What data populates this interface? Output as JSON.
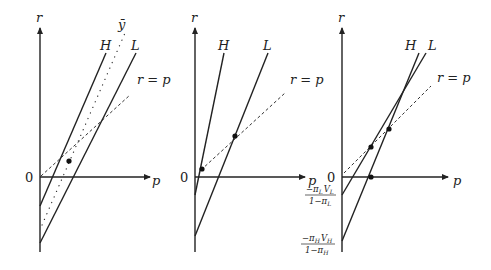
{
  "diagram": {
    "panels": [
      {
        "id": "panel-1",
        "axis_y_label": "r",
        "axis_x_label": "p",
        "origin_label": "0",
        "line_labels": {
          "H": "H",
          "L": "L",
          "ybar": "ȳ",
          "diag": "r = p"
        }
      },
      {
        "id": "panel-2",
        "axis_y_label": "r",
        "axis_x_label": "p",
        "origin_label": "0",
        "line_labels": {
          "H": "H",
          "L": "L",
          "diag": "r = p"
        }
      },
      {
        "id": "panel-3",
        "axis_y_label": "r",
        "axis_x_label": "p",
        "origin_label": "0",
        "line_labels": {
          "H": "H",
          "L": "L",
          "diag": "r = p"
        },
        "intercepts": {
          "L_num": "−π",
          "L_num_sub": "L",
          "L_num_v": "V",
          "L_num_vsub": "L",
          "L_den": "1−π",
          "L_den_sub": "L",
          "H_num": "−π",
          "H_num_sub": "H",
          "H_num_v": "V",
          "H_num_vsub": "H",
          "H_den": "1−π",
          "H_den_sub": "H"
        }
      }
    ]
  }
}
